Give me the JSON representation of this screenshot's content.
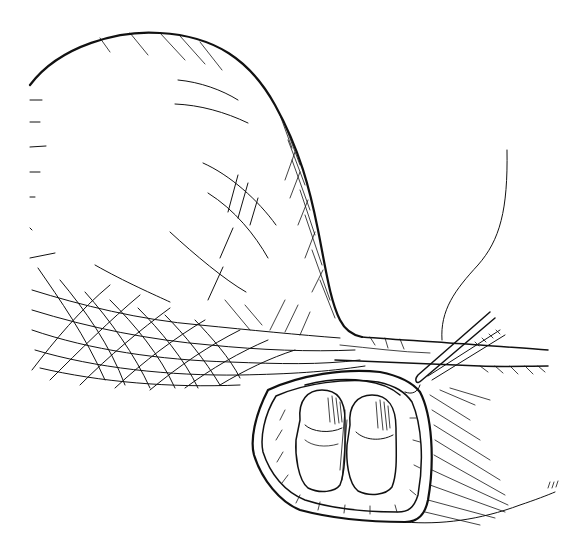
{
  "illustration": {
    "kind": "medical line drawing",
    "style": "black pen-and-ink with cross-hatching on white",
    "colors": {
      "ink": "#111111",
      "background": "#ffffff"
    },
    "elements": [
      "distended-sac",
      "neck-of-sac",
      "incised-opening",
      "left-rounded-structure",
      "right-rounded-structure",
      "forceps",
      "suture-thread"
    ]
  }
}
